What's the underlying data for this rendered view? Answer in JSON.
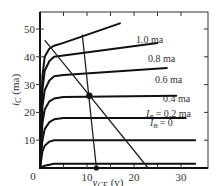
{
  "chart_data": {
    "type": "line",
    "title": "",
    "xlabel": "v_CE (v)",
    "xlabel_main": "v",
    "xlabel_sub": "CE",
    "xlabel_unit": "(v)",
    "ylabel": "i_C (ma)",
    "ylabel_main": "i",
    "ylabel_sub": "C",
    "ylabel_unit": "(ma)",
    "xlim": [
      0,
      35
    ],
    "ylim": [
      0,
      55
    ],
    "x_ticks": [
      0,
      10,
      20,
      30
    ],
    "x_tick_labels": [
      "0",
      "10",
      "20",
      "30"
    ],
    "y_ticks": [
      10,
      20,
      30,
      40,
      50
    ],
    "y_tick_labels": [
      "10",
      "20",
      "30",
      "40",
      "50"
    ],
    "origin_label": "0",
    "grid": false,
    "legend": "inline labels on curves",
    "series": [
      {
        "name": "I_B = 0",
        "label": "= 0",
        "label_prefix": "I",
        "label_sub": "B",
        "x": [
          0,
          0.5,
          1,
          2,
          3,
          33
        ],
        "y": [
          0,
          0.5,
          0.8,
          1.2,
          1.5,
          1.5
        ]
      },
      {
        "name": "I_B = 0.2 ma",
        "label": "= 0.2 ma",
        "label_prefix": "I",
        "label_sub": "B",
        "x": [
          0,
          0.5,
          1,
          2,
          3,
          5,
          33
        ],
        "y": [
          0,
          6,
          8,
          9.5,
          10,
          10,
          10
        ]
      },
      {
        "name": "0.4 ma",
        "label": "0.4 ma",
        "x": [
          0,
          0.5,
          1,
          2,
          3,
          5,
          31
        ],
        "y": [
          0,
          10,
          14,
          16.5,
          17.5,
          18,
          18
        ]
      },
      {
        "name": "0.6 ma",
        "label": "0.6 ma",
        "x": [
          0,
          0.5,
          1,
          2,
          3,
          5,
          29
        ],
        "y": [
          0,
          16,
          21,
          24,
          25,
          25.5,
          26
        ]
      },
      {
        "name": "0.8 ma",
        "label": "0.8 ma",
        "x": [
          0,
          0.5,
          1,
          2,
          3,
          5,
          27
        ],
        "y": [
          0,
          22,
          28,
          31.5,
          33,
          33.5,
          36
        ]
      },
      {
        "name": "1.0 ma",
        "label": "1.0 ma",
        "x": [
          0,
          0.5,
          1,
          2,
          3,
          5,
          25
        ],
        "y": [
          0,
          28,
          35,
          38.5,
          40,
          40.5,
          45
        ]
      },
      {
        "name": "1.2 ma (unlabeled)",
        "label": "",
        "x": [
          0,
          0.5,
          1,
          2,
          3,
          5,
          17
        ],
        "y": [
          0,
          33,
          40,
          43,
          44,
          45,
          52
        ]
      }
    ],
    "annotations": {
      "load_line": {
        "x": [
          1,
          23
        ],
        "y": [
          46,
          0
        ]
      },
      "q_point": {
        "x": 10.5,
        "y": 26
      },
      "bias_line": {
        "x": [
          9,
          12
        ],
        "y": [
          48,
          0
        ]
      },
      "bias_dot": {
        "x": 12,
        "y": 0
      }
    }
  }
}
